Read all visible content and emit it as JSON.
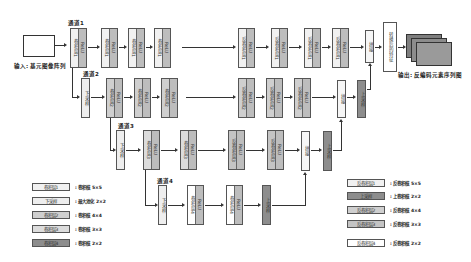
{
  "input": {
    "label": "输入: 基元图像阵列"
  },
  "output": {
    "label": "输出: 反编码元素序列图",
    "feature_block": "转换后的特征"
  },
  "channels": [
    {
      "label": "通道1"
    },
    {
      "label": "通道2"
    },
    {
      "label": "通道3"
    },
    {
      "label": "通道4"
    }
  ],
  "layers": {
    "conv1": "卷积层1",
    "conv2": "卷积层2",
    "conv3": "卷积层3",
    "conv4": "卷积层4",
    "deconv1": "反卷积层1",
    "deconv2": "反卷积层2",
    "deconv3": "反卷积层3",
    "deconv4": "反卷积层4",
    "relu": "ReLU",
    "down": "下采样",
    "up": "上采样",
    "concat": "拼接"
  },
  "legend_left": [
    {
      "box": "卷积层1",
      "desc": ": 卷积核 5×5",
      "color": "#f1f1f1"
    },
    {
      "box": "下采样",
      "desc": ": 最大池化 2×2",
      "color": "#eeeeee"
    },
    {
      "box": "卷积层2",
      "desc": ": 卷积核 4×4",
      "color": "#cfcfcf"
    },
    {
      "box": "卷积层3",
      "desc": ": 卷积核 3×3",
      "color": "#dcdcdc"
    },
    {
      "box": "卷积层4",
      "desc": ": 卷积核 2×2",
      "color": "#8d8d8d"
    }
  ],
  "legend_right": [
    {
      "box": "反卷积层1",
      "desc": ": 反卷积核 5×5",
      "color": "#f1f1f1"
    },
    {
      "box": "上采样",
      "desc": ": 上卷积核 2×2",
      "color": "#8d8d8d"
    },
    {
      "box": "反卷积层2",
      "desc": ": 反卷积核 4×4",
      "color": "#cfcfcf"
    },
    {
      "box": "反卷积层3",
      "desc": ": 反卷积核 3×3",
      "color": "#c4c4c4"
    },
    {
      "box": "反卷积层4",
      "desc": ": 反卷积核 2×2",
      "color": "#ffffff"
    }
  ]
}
